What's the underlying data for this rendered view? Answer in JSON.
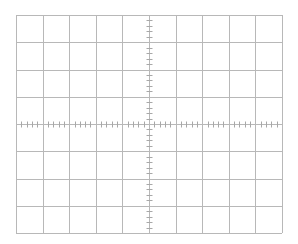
{
  "graticule": {
    "left": 16,
    "top": 15,
    "width": 266,
    "height": 218,
    "h_divisions": 10,
    "v_divisions": 8,
    "minor_ticks_per_division": 5,
    "grid_color": "#b8b8b8",
    "tick_color": "#a8a8a8",
    "background": "#ffffff"
  }
}
